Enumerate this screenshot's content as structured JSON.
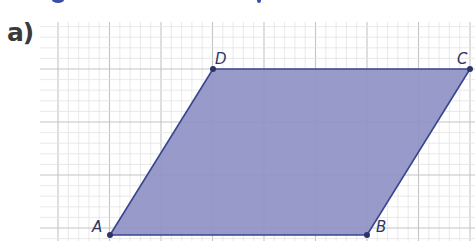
{
  "exercise": {
    "part_label": "a)"
  },
  "figure": {
    "shape": "parallelogram",
    "fill_color": "#8f93c6",
    "stroke_color": "#3a4690",
    "grid": {
      "minor_spacing_px": 10.3,
      "major_every": 5,
      "minor_color": "#e3e3e3",
      "major_color": "#c4c4c4"
    },
    "vertices": [
      {
        "name": "A",
        "x": 110,
        "y": 235
      },
      {
        "name": "B",
        "x": 367,
        "y": 235
      },
      {
        "name": "C",
        "x": 470,
        "y": 69
      },
      {
        "name": "D",
        "x": 213,
        "y": 69
      }
    ],
    "labels": {
      "A": "A",
      "B": "B",
      "C": "C",
      "D": "D"
    }
  }
}
